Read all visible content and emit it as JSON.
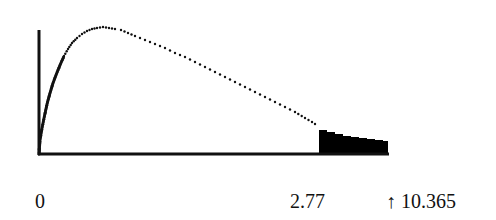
{
  "chart_data": {
    "type": "area",
    "title": "",
    "xlabel": "",
    "ylabel": "",
    "x_tick_labels": [
      "0",
      "2.77",
      "↑ 10.365"
    ],
    "critical_value": 2.77,
    "test_statistic": 10.365,
    "test_statistic_marker": "↑",
    "shaded_region": {
      "from": 2.77,
      "to": "right tail",
      "color": "#000000"
    },
    "curve_style": "dotted",
    "grid": false,
    "legend": null,
    "curve_points_px": [
      [
        39,
        154
      ],
      [
        40,
        140
      ],
      [
        42,
        128
      ],
      [
        44,
        118
      ],
      [
        47,
        104
      ],
      [
        50,
        93
      ],
      [
        53,
        83
      ],
      [
        56,
        75
      ],
      [
        60,
        65
      ],
      [
        64,
        56
      ],
      [
        68,
        49
      ],
      [
        72,
        43
      ],
      [
        77,
        38
      ],
      [
        82,
        34
      ],
      [
        87,
        31
      ],
      [
        92,
        29
      ],
      [
        97,
        28
      ],
      [
        103,
        27
      ],
      [
        109,
        28
      ],
      [
        115,
        29
      ],
      [
        121,
        30
      ],
      [
        128,
        33
      ],
      [
        135,
        36
      ],
      [
        145,
        40
      ],
      [
        155,
        44
      ],
      [
        165,
        48
      ],
      [
        175,
        53
      ],
      [
        185,
        57
      ],
      [
        195,
        62
      ],
      [
        205,
        67
      ],
      [
        215,
        72
      ],
      [
        225,
        77
      ],
      [
        235,
        82
      ],
      [
        245,
        87
      ],
      [
        255,
        92
      ],
      [
        265,
        97
      ],
      [
        275,
        102
      ],
      [
        285,
        107
      ],
      [
        295,
        112
      ],
      [
        305,
        118
      ],
      [
        312,
        122
      ],
      [
        318,
        126
      ]
    ],
    "tail_steps_px": [
      [
        319,
        130
      ],
      [
        327,
        132
      ],
      [
        335,
        134
      ],
      [
        343,
        136
      ],
      [
        351,
        137
      ],
      [
        359,
        138
      ],
      [
        367,
        139
      ],
      [
        375,
        140
      ],
      [
        383,
        141
      ],
      [
        388,
        142
      ]
    ]
  },
  "labels": {
    "origin": "0",
    "critical": "2.77",
    "statistic": "↑ 10.365"
  },
  "colors": {
    "ink": "#111111",
    "fill": "#000000",
    "background": "#ffffff"
  }
}
